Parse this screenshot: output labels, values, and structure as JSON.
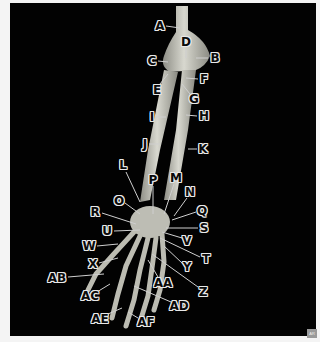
{
  "figure": {
    "background_color": "#020202",
    "bone_color": "#c9c9c0",
    "label_fill": "#0a0a0a",
    "label_outline": "#e8e8e8",
    "watermark": "AR"
  },
  "labels": [
    {
      "id": "A",
      "text": "A",
      "x": 160,
      "y": 26
    },
    {
      "id": "B",
      "text": "B",
      "x": 215,
      "y": 58
    },
    {
      "id": "C",
      "text": "C",
      "x": 152,
      "y": 61
    },
    {
      "id": "D",
      "text": "D",
      "x": 186,
      "y": 42
    },
    {
      "id": "E",
      "text": "E",
      "x": 157,
      "y": 90
    },
    {
      "id": "F",
      "text": "F",
      "x": 204,
      "y": 79
    },
    {
      "id": "G",
      "text": "G",
      "x": 194,
      "y": 99
    },
    {
      "id": "H",
      "text": "H",
      "x": 204,
      "y": 116
    },
    {
      "id": "I",
      "text": "I",
      "x": 152,
      "y": 117
    },
    {
      "id": "J",
      "text": "J",
      "x": 145,
      "y": 144
    },
    {
      "id": "K",
      "text": "K",
      "x": 203,
      "y": 149
    },
    {
      "id": "L",
      "text": "L",
      "x": 123,
      "y": 165
    },
    {
      "id": "M",
      "text": "M",
      "x": 176,
      "y": 178
    },
    {
      "id": "N",
      "text": "N",
      "x": 190,
      "y": 192
    },
    {
      "id": "O",
      "text": "O",
      "x": 119,
      "y": 201
    },
    {
      "id": "P",
      "text": "P",
      "x": 153,
      "y": 180
    },
    {
      "id": "Q",
      "text": "Q",
      "x": 202,
      "y": 211
    },
    {
      "id": "R",
      "text": "R",
      "x": 95,
      "y": 212
    },
    {
      "id": "S",
      "text": "S",
      "x": 204,
      "y": 228
    },
    {
      "id": "T",
      "text": "T",
      "x": 206,
      "y": 259
    },
    {
      "id": "U",
      "text": "U",
      "x": 107,
      "y": 231
    },
    {
      "id": "V",
      "text": "V",
      "x": 187,
      "y": 241
    },
    {
      "id": "W",
      "text": "W",
      "x": 89,
      "y": 246
    },
    {
      "id": "X",
      "text": "X",
      "x": 93,
      "y": 264
    },
    {
      "id": "Y",
      "text": "Y",
      "x": 187,
      "y": 267
    },
    {
      "id": "Z",
      "text": "Z",
      "x": 203,
      "y": 292
    },
    {
      "id": "AA",
      "text": "AA",
      "x": 163,
      "y": 283
    },
    {
      "id": "AB",
      "text": "AB",
      "x": 57,
      "y": 278
    },
    {
      "id": "AC",
      "text": "AC",
      "x": 90,
      "y": 296
    },
    {
      "id": "AD",
      "text": "AD",
      "x": 179,
      "y": 306
    },
    {
      "id": "AE",
      "text": "AE",
      "x": 100,
      "y": 319
    },
    {
      "id": "AF",
      "text": "AF",
      "x": 146,
      "y": 322
    }
  ]
}
